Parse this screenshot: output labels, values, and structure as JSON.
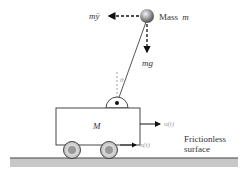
{
  "diagram": {
    "mass_label": "Mass",
    "mass_symbol": "m",
    "inertial_force_label": "mÿ",
    "gravity_force_label": "mg",
    "angle_label": "θ",
    "cart_label": "M",
    "input_force_label": "u(t)",
    "position_label": "x(t)",
    "surface_label_line1": "Frictionless",
    "surface_label_line2": "surface",
    "colors": {
      "ground": "#c8c8c8",
      "ground_line": "#444444",
      "cart_stroke": "#333333",
      "wheel_outer": "#d0d0d0",
      "wheel_inner": "#888888",
      "bob": "#888888",
      "arrow": "#111111"
    }
  }
}
